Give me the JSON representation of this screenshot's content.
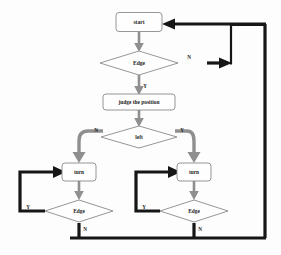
{
  "diagram": {
    "type": "flowchart",
    "canvas": {
      "width": 281,
      "height": 255,
      "background": "#fdfdfd"
    },
    "colors": {
      "node_fill": "#fefefe",
      "node_stroke": "#8a8a8a",
      "text": "#1c1c1c",
      "connector_gray": "#8f8f8f",
      "connector_black": "#161616"
    },
    "nodes": [
      {
        "id": "start",
        "kind": "process",
        "label": "start",
        "x": 139,
        "y": 22,
        "w": 46,
        "h": 19,
        "font_size": 5.6
      },
      {
        "id": "edge1",
        "kind": "decision",
        "label": "Edge",
        "x": 139,
        "y": 63,
        "w": 78,
        "h": 24,
        "font_size": 5.6
      },
      {
        "id": "judge",
        "kind": "process",
        "label": "judge the position",
        "x": 139,
        "y": 102,
        "w": 72,
        "h": 16,
        "font_size": 5.4
      },
      {
        "id": "left",
        "kind": "decision",
        "label": "left",
        "x": 139,
        "y": 137,
        "w": 76,
        "h": 22,
        "font_size": 5.4
      },
      {
        "id": "turnL",
        "kind": "process",
        "label": "turn",
        "x": 79,
        "y": 172,
        "w": 34,
        "h": 18,
        "font_size": 5.4
      },
      {
        "id": "turnR",
        "kind": "process",
        "label": "turn",
        "x": 194,
        "y": 172,
        "w": 34,
        "h": 18,
        "font_size": 5.4
      },
      {
        "id": "edgeL",
        "kind": "decision",
        "label": "Edge",
        "x": 79,
        "y": 211,
        "w": 68,
        "h": 22,
        "font_size": 5.4
      },
      {
        "id": "edgeR",
        "kind": "decision",
        "label": "Edge",
        "x": 194,
        "y": 211,
        "w": 68,
        "h": 22,
        "font_size": 5.4
      }
    ],
    "branch_labels": [
      {
        "id": "edge1-no",
        "text": "N",
        "x": 189,
        "y": 58
      },
      {
        "id": "edge1-yes",
        "text": "Y",
        "x": 145,
        "y": 87
      },
      {
        "id": "left-no",
        "text": "N",
        "x": 96,
        "y": 132
      },
      {
        "id": "left-yes",
        "text": "Y",
        "x": 182,
        "y": 132
      },
      {
        "id": "edgeL-yes",
        "text": "Y",
        "x": 28,
        "y": 208
      },
      {
        "id": "edgeL-no",
        "text": "N",
        "x": 85,
        "y": 230
      },
      {
        "id": "edgeR-yes",
        "text": "Y",
        "x": 144,
        "y": 208
      },
      {
        "id": "edgeR-no",
        "text": "N",
        "x": 200,
        "y": 230
      }
    ],
    "edges": [
      {
        "id": "start-to-edge1",
        "from": "start",
        "to": "edge1",
        "style": "gray",
        "label": ""
      },
      {
        "id": "edge1-yes-judge",
        "from": "edge1",
        "to": "judge",
        "style": "gray",
        "label": "Y"
      },
      {
        "id": "judge-to-left",
        "from": "judge",
        "to": "left",
        "style": "gray",
        "label": ""
      },
      {
        "id": "left-no-turnL",
        "from": "left",
        "to": "turnL",
        "style": "gray-thick",
        "label": "N"
      },
      {
        "id": "left-yes-turnR",
        "from": "left",
        "to": "turnR",
        "style": "gray-thick",
        "label": "Y"
      },
      {
        "id": "turnL-to-edgeL",
        "from": "turnL",
        "to": "edgeL",
        "style": "gray",
        "label": ""
      },
      {
        "id": "turnR-to-edgeR",
        "from": "turnR",
        "to": "edgeR",
        "style": "gray",
        "label": ""
      },
      {
        "id": "edgeL-yes-loop",
        "from": "edgeL",
        "to": "turnL",
        "style": "black",
        "label": "Y"
      },
      {
        "id": "edgeR-yes-loop",
        "from": "edgeR",
        "to": "turnR",
        "style": "black",
        "label": "Y"
      },
      {
        "id": "edgeL-no-return",
        "from": "edgeL",
        "to": "start",
        "style": "black",
        "label": "N"
      },
      {
        "id": "edgeR-no-return",
        "from": "edgeR",
        "to": "start",
        "style": "black",
        "label": "N"
      },
      {
        "id": "edge1-no-return",
        "from": "edge1",
        "to": "start",
        "style": "black",
        "label": "N"
      }
    ]
  }
}
